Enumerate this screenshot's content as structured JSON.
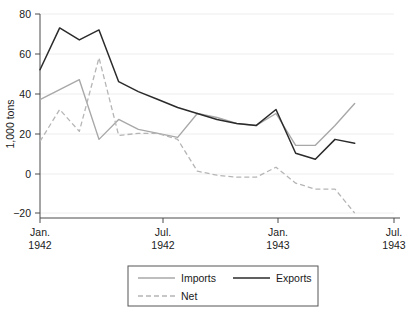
{
  "chart_data": {
    "type": "line",
    "title": "",
    "xlabel": "",
    "ylabel": "1,000 tons",
    "ylim": [
      -20,
      80
    ],
    "yticks": [
      -20,
      0,
      20,
      40,
      60,
      80
    ],
    "ytick_labels": [
      "−20",
      "0",
      "20",
      "40",
      "60",
      "80"
    ],
    "xlim": [
      "1942-01",
      "1943-07"
    ],
    "xticks": [
      "1942-01",
      "1942-07",
      "1943-01",
      "1943-07"
    ],
    "xtick_labels": [
      {
        "line1": "Jan.",
        "line2": "1942"
      },
      {
        "line1": "Jul.",
        "line2": "1942"
      },
      {
        "line1": "Jan.",
        "line2": "1943"
      },
      {
        "line1": "Jul.",
        "line2": "1943"
      }
    ],
    "grid": true,
    "legend_position": "bottom",
    "x": [
      "1942-01",
      "1942-02",
      "1942-03",
      "1942-04",
      "1942-05",
      "1942-06",
      "1942-07",
      "1942-08",
      "1942-09",
      "1942-10",
      "1942-11",
      "1942-12",
      "1943-01",
      "1943-02",
      "1943-03",
      "1943-04",
      "1943-05"
    ],
    "series": [
      {
        "name": "Imports",
        "style": "solid",
        "color": "#a8a8a8",
        "values": [
          37,
          42,
          47,
          17,
          27,
          22,
          20,
          18,
          30,
          28,
          25,
          24,
          30,
          14,
          14,
          24,
          35
        ]
      },
      {
        "name": "Exports",
        "style": "solid",
        "color": "#2b2b2b",
        "values": [
          52,
          73,
          67,
          72,
          46,
          41,
          37,
          33,
          30,
          27,
          25,
          24,
          32,
          10,
          7,
          17,
          15
        ]
      },
      {
        "name": "Net",
        "style": "dashed",
        "color": "#b5b5b5",
        "values": [
          16,
          32,
          21,
          58,
          19,
          20,
          20,
          17,
          1,
          -1,
          -2,
          -2,
          3,
          -5,
          -8,
          -8,
          -20
        ]
      }
    ]
  },
  "legend": {
    "entries": [
      {
        "label": "Imports",
        "key": "imports"
      },
      {
        "label": "Exports",
        "key": "exports"
      },
      {
        "label": "Net",
        "key": "net"
      }
    ]
  },
  "axis": {
    "y_title": "1,000 tons"
  },
  "ticks": {
    "y": {
      "t80": "80",
      "t60": "60",
      "t40": "40",
      "t20": "20",
      "t0": "0",
      "tm20": "−20"
    },
    "x": {
      "jan42_month": "Jan.",
      "jan42_year": "1942",
      "jul42_month": "Jul.",
      "jul42_year": "1942",
      "jan43_month": "Jan.",
      "jan43_year": "1943",
      "jul43_month": "Jul.",
      "jul43_year": "1943"
    }
  }
}
